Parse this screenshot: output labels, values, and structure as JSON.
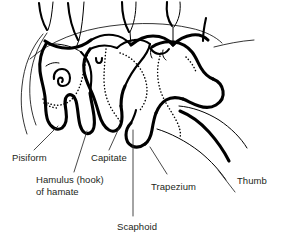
{
  "figure": {
    "background_color": "#ffffff",
    "line_color": "#000000",
    "text_color": "#231f20",
    "leader_color": "#333333"
  },
  "labels": {
    "pisiform": "Pisiform",
    "hamulus_line1": "Hamulus (hook)",
    "hamulus_line2": "of hamate",
    "capitate": "Capitate",
    "trapezium": "Trapezium",
    "thumb": "Thumb",
    "scaphoid": "Scaphoid"
  },
  "structures": [
    {
      "name": "pisiform",
      "label": "Pisiform"
    },
    {
      "name": "hamulus-of-hamate",
      "label": "Hamulus (hook) of hamate"
    },
    {
      "name": "capitate",
      "label": "Capitate"
    },
    {
      "name": "trapezium",
      "label": "Trapezium"
    },
    {
      "name": "thumb",
      "label": "Thumb"
    },
    {
      "name": "scaphoid",
      "label": "Scaphoid"
    }
  ]
}
